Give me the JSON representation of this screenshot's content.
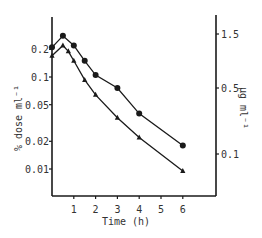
{
  "chart_data": {
    "type": "line",
    "title": "",
    "xlabel": "Time (h)",
    "ylabel_left": "% dose ml⁻¹",
    "ylabel_right": "µg ml⁻¹",
    "x_ticks": [
      1,
      2,
      3,
      4,
      5,
      6
    ],
    "x_tick_labels": [
      "1",
      "2",
      "3",
      "4",
      "5",
      "6"
    ],
    "xlim": [
      0,
      6.6
    ],
    "y_left_scale": "log",
    "y_left_ticks": [
      0.2,
      0.1,
      0.05,
      0.02,
      0.01
    ],
    "y_left_tick_labels": [
      "0.2",
      "0.1",
      "0.05",
      "0.02",
      "0.01"
    ],
    "y_left_lim": [
      0.0052,
      0.4
    ],
    "y_right_scale": "log",
    "y_right_ticks": [
      1.5,
      0.5,
      0.1
    ],
    "y_right_tick_labels": [
      "1.5",
      "0.5",
      "0.1"
    ],
    "grid": false,
    "legend": null,
    "series": [
      {
        "name": "circles",
        "marker": "circle",
        "x": [
          0,
          0.5,
          1,
          1.5,
          2,
          3,
          4,
          6
        ],
        "values": [
          0.21,
          0.28,
          0.22,
          0.15,
          0.105,
          0.076,
          0.04,
          0.018
        ]
      },
      {
        "name": "triangles",
        "marker": "triangle",
        "x": [
          0,
          0.5,
          0.75,
          1,
          1.5,
          2,
          3,
          4,
          6
        ],
        "values": [
          0.17,
          0.22,
          0.19,
          0.15,
          0.093,
          0.064,
          0.036,
          0.022,
          0.0095
        ]
      }
    ]
  }
}
